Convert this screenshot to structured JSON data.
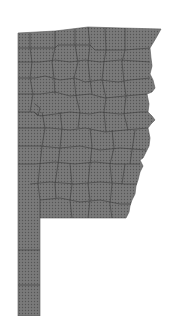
{
  "map": {
    "title": "Arkansas county map (shaded)",
    "region": "Arkansas",
    "fill_color": "#7a7a7a",
    "dot_color": "#5a5a5a",
    "border_color": "#3a3a3a",
    "background_color": "#ffffff",
    "pattern": "stippled dots",
    "labels": []
  }
}
